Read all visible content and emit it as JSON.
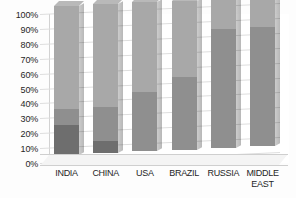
{
  "chart_data": {
    "type": "bar",
    "subtype": "100% stacked column (3D)",
    "title": "",
    "subtitle": "",
    "xlabel": "",
    "ylabel": "",
    "ylim": [
      0,
      100
    ],
    "y_unit": "%",
    "grid": true,
    "legend": "none",
    "categories": [
      "INDIA",
      "CHINA",
      "USA",
      "BRAZIL",
      "RUSSIA",
      "MIDDLE EAST"
    ],
    "y_ticks": [
      "0%",
      "10%",
      "20%",
      "30%",
      "40%",
      "50%",
      "60%",
      "70%",
      "80%",
      "90%",
      "100%"
    ],
    "y_tick_values": [
      0,
      10,
      20,
      30,
      40,
      50,
      60,
      70,
      80,
      90,
      100
    ],
    "series": [
      {
        "name": "Series 1",
        "color": "#6e6e6e",
        "values": [
          20,
          8,
          0,
          0,
          0,
          0
        ]
      },
      {
        "name": "Series 2",
        "color": "#8f8f8f",
        "values": [
          11,
          23,
          40,
          49,
          80,
          80
        ]
      },
      {
        "name": "Series 3",
        "color": "#a8a8a8",
        "values": [
          69,
          69,
          60,
          51,
          20,
          20
        ]
      }
    ],
    "annotations": []
  },
  "axis": {
    "y_labels": [
      "100%",
      "90%",
      "80%",
      "70%",
      "60%",
      "50%",
      "40%",
      "30%",
      "20%",
      "10%",
      "0%"
    ]
  },
  "x_labels": [
    {
      "text": "INDIA"
    },
    {
      "text": "CHINA"
    },
    {
      "text": "USA"
    },
    {
      "text": "BRAZIL"
    },
    {
      "text": "RUSSIA"
    },
    {
      "text": "MIDDLE\nEAST"
    }
  ],
  "colors": {
    "segment_bottom": "#6e6e6e",
    "segment_middle": "#8f8f8f",
    "segment_top": "#a8a8a8",
    "bar_top_face": "#b9b9b9",
    "gridline": "#dedede",
    "plot_background": "#ffffff",
    "text": "#1f1f1f"
  }
}
